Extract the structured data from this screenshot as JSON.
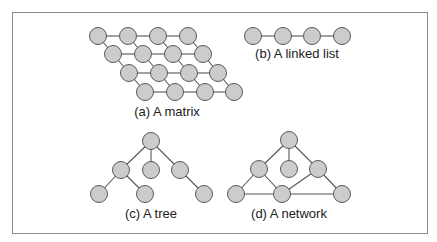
{
  "figure": {
    "frame": {
      "x": 12,
      "y": 12,
      "width": 416,
      "height": 222,
      "color": "#8a8a8a"
    },
    "style": {
      "node_fill": "#cccccc",
      "node_stroke": "#5a5a5a",
      "edge_color": "#555555",
      "node_radius": 8.5,
      "text_color": "#222222"
    },
    "panels": [
      {
        "id": "a",
        "caption": "(a) A matrix",
        "caption_pos": {
          "x": 167,
          "y": 105
        },
        "nodes": [
          [
            98,
            36
          ],
          [
            128,
            36
          ],
          [
            158,
            36
          ],
          [
            188,
            36
          ],
          [
            113,
            54
          ],
          [
            143,
            54
          ],
          [
            173,
            54
          ],
          [
            203,
            54
          ],
          [
            129,
            73
          ],
          [
            159,
            73
          ],
          [
            189,
            73
          ],
          [
            218,
            73
          ],
          [
            145,
            92
          ],
          [
            175,
            92
          ],
          [
            205,
            92
          ],
          [
            234,
            92
          ]
        ],
        "edges": [
          [
            0,
            1
          ],
          [
            1,
            2
          ],
          [
            2,
            3
          ],
          [
            4,
            5
          ],
          [
            5,
            6
          ],
          [
            6,
            7
          ],
          [
            8,
            9
          ],
          [
            9,
            10
          ],
          [
            10,
            11
          ],
          [
            12,
            13
          ],
          [
            13,
            14
          ],
          [
            14,
            15
          ],
          [
            0,
            4
          ],
          [
            1,
            5
          ],
          [
            2,
            6
          ],
          [
            3,
            7
          ],
          [
            4,
            8
          ],
          [
            5,
            9
          ],
          [
            6,
            10
          ],
          [
            7,
            11
          ],
          [
            8,
            12
          ],
          [
            9,
            13
          ],
          [
            10,
            14
          ],
          [
            11,
            15
          ]
        ]
      },
      {
        "id": "b",
        "caption": "(b) A linked list",
        "caption_pos": {
          "x": 297,
          "y": 47
        },
        "nodes": [
          [
            253,
            36
          ],
          [
            283,
            36
          ],
          [
            312,
            36
          ],
          [
            342,
            36
          ]
        ],
        "edges": [
          [
            0,
            1
          ],
          [
            1,
            2
          ],
          [
            2,
            3
          ]
        ]
      },
      {
        "id": "c",
        "caption": "(c) A tree",
        "caption_pos": {
          "x": 151,
          "y": 207
        },
        "nodes": [
          [
            151,
            141
          ],
          [
            121,
            170
          ],
          [
            151,
            170
          ],
          [
            180,
            170
          ],
          [
            99,
            194
          ],
          [
            145,
            194
          ],
          [
            204,
            194
          ]
        ],
        "edges": [
          [
            0,
            1
          ],
          [
            0,
            2
          ],
          [
            0,
            3
          ],
          [
            1,
            4
          ],
          [
            1,
            5
          ],
          [
            3,
            6
          ]
        ]
      },
      {
        "id": "d",
        "caption": "(d) A network",
        "caption_pos": {
          "x": 289,
          "y": 207
        },
        "nodes": [
          [
            289,
            140
          ],
          [
            259,
            169
          ],
          [
            289,
            169
          ],
          [
            318,
            169
          ],
          [
            236,
            194
          ],
          [
            282,
            194
          ],
          [
            342,
            194
          ]
        ],
        "edges": [
          [
            0,
            1
          ],
          [
            0,
            2
          ],
          [
            0,
            3
          ],
          [
            1,
            4
          ],
          [
            1,
            5
          ],
          [
            3,
            5
          ],
          [
            3,
            6
          ],
          [
            4,
            5
          ],
          [
            5,
            6
          ]
        ]
      }
    ]
  }
}
